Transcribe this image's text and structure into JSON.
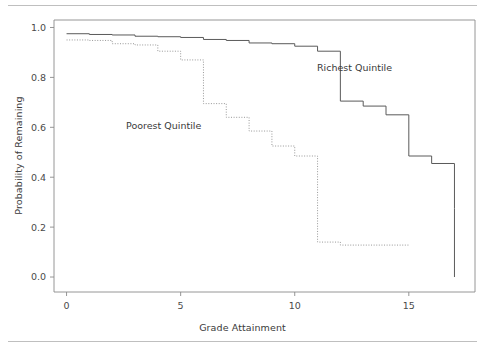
{
  "chart_data": {
    "type": "line",
    "title": "",
    "subtitle": "",
    "xlabel": "Grade Attainment",
    "ylabel": "Probability of Remaining",
    "xlim": [
      -0.55,
      17.9
    ],
    "ylim": [
      -0.06,
      1.03
    ],
    "xticks": [
      0,
      5,
      10,
      15
    ],
    "xticklabels": [
      "0",
      "5",
      "10",
      "15"
    ],
    "yticks": [
      0.0,
      0.2,
      0.4,
      0.6,
      0.8,
      1.0
    ],
    "yticklabels": [
      "0.0",
      "0.2",
      "0.4",
      "0.6",
      "0.8",
      "1.0"
    ],
    "grid": false,
    "legend_position": "inline-annotations",
    "step_style": "post",
    "series": [
      {
        "name": "Richest Quintile",
        "style": "solid",
        "color": "#5a5a5a",
        "label_x": 12.4,
        "label_y": 0.805,
        "x": [
          0,
          1,
          2,
          3,
          4,
          5,
          6,
          7,
          8,
          9,
          10,
          11,
          12,
          13,
          14,
          15,
          16,
          17,
          17
        ],
        "values": [
          0.975,
          0.972,
          0.97,
          0.965,
          0.963,
          0.96,
          0.952,
          0.948,
          0.938,
          0.935,
          0.925,
          0.905,
          0.705,
          0.685,
          0.65,
          0.485,
          0.455,
          0.275,
          0.0
        ]
      },
      {
        "name": "Poorest Quintile",
        "style": "dotted",
        "color": "#8c8c8c",
        "label_x": 5.05,
        "label_y": 0.612,
        "x": [
          0,
          1,
          2,
          3,
          4,
          5,
          6,
          7,
          8,
          9,
          10,
          11,
          12,
          15
        ],
        "values": [
          0.95,
          0.948,
          0.935,
          0.93,
          0.905,
          0.87,
          0.695,
          0.64,
          0.585,
          0.525,
          0.485,
          0.14,
          0.128,
          0.128
        ]
      }
    ]
  },
  "annotations": {
    "richest": "Richest Quintile",
    "poorest": "Poorest Quintile"
  },
  "axes": {
    "x_title": "Grade Attainment",
    "y_title": "Probability of Remaining"
  },
  "colors": {
    "frame": "#8a8a8a",
    "rule": "#bfbfbf",
    "text": "#3a3a3a",
    "richest": "#5a5a5a",
    "poorest": "#8c8c8c",
    "background": "#ffffff"
  }
}
